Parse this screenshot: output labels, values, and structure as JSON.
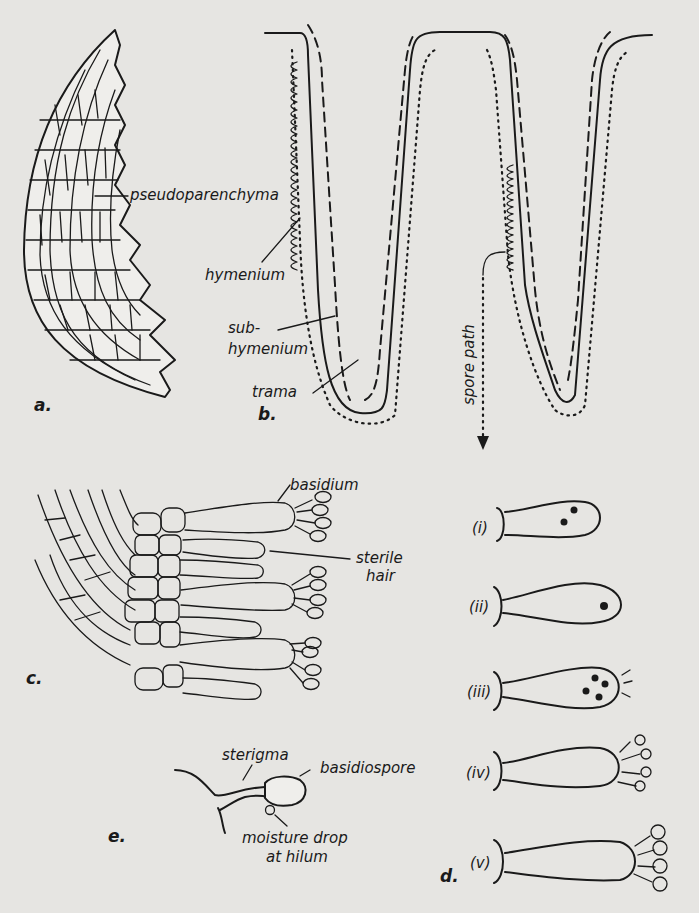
{
  "figure": {
    "background": "#e6e5e2",
    "ink_color": "#1a1a1a",
    "panels": {
      "a": {
        "label": "a.",
        "callouts": {
          "pseudoparenchyma": "pseudoparenchyma"
        }
      },
      "b": {
        "label": "b.",
        "callouts": {
          "hymenium": "hymenium",
          "subhymenium_line1": "sub-",
          "subhymenium_line2": "hymenium",
          "trama": "trama",
          "spore_path": "spore path"
        }
      },
      "c": {
        "label": "c.",
        "callouts": {
          "basidium": "basidium",
          "sterile_hair_line1": "sterile",
          "sterile_hair_line2": "hair"
        }
      },
      "d": {
        "label": "d.",
        "stages": [
          "(i)",
          "(ii)",
          "(iii)",
          "(iv)",
          "(v)"
        ]
      },
      "e": {
        "label": "e.",
        "callouts": {
          "sterigma": "sterigma",
          "basidiospore": "basidiospore",
          "moisture_line1": "moisture drop",
          "moisture_line2": "at hilum"
        }
      }
    }
  }
}
